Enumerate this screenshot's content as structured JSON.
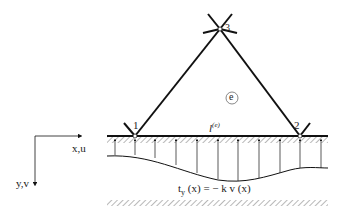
{
  "diagram": {
    "nodes": [
      {
        "id": "1",
        "label": "1"
      },
      {
        "id": "2",
        "label": "2"
      },
      {
        "id": "3",
        "label": "3"
      }
    ],
    "element_label": "e",
    "edge_label_base": "l",
    "edge_label_sup": "(e)",
    "axis_x_label": "x,u",
    "axis_y_label": "y,v",
    "traction_formula": "t",
    "traction_sub": "y",
    "traction_rest": " (x) = − k v (x)",
    "colors": {
      "line": "#111111",
      "hatch": "#888888"
    }
  }
}
